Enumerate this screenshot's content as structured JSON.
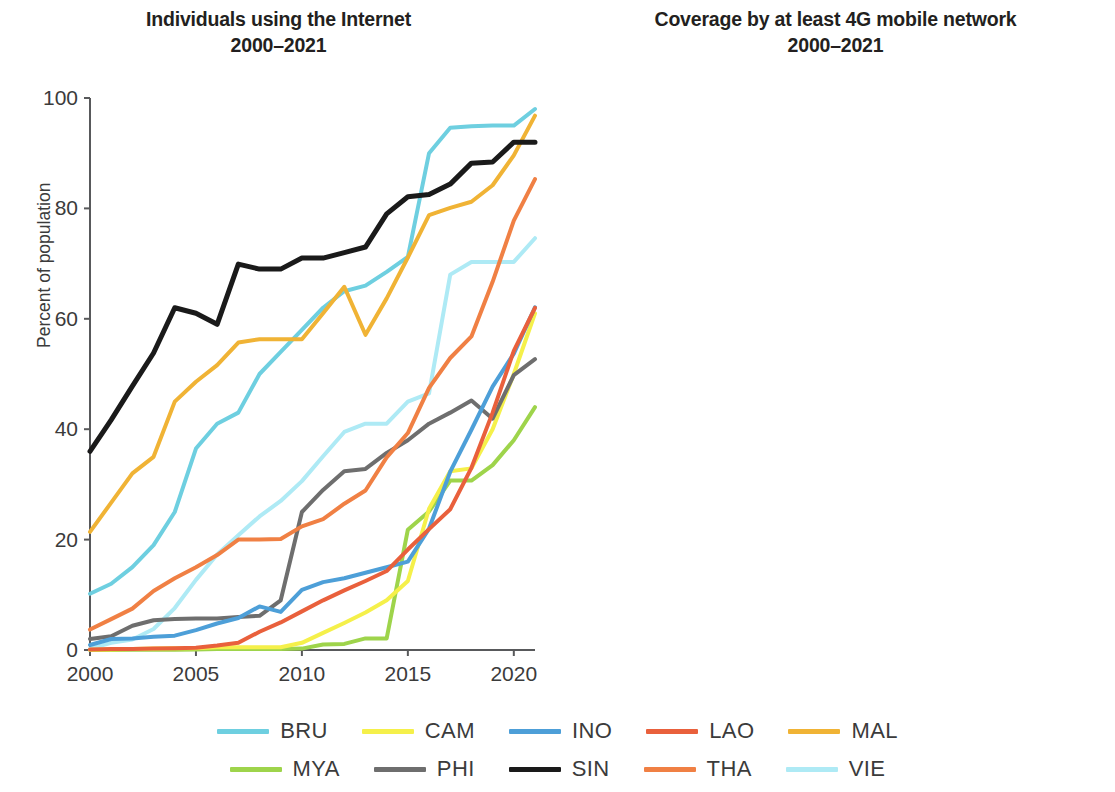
{
  "panels": [
    {
      "title": "Individuals using the Internet",
      "subtitle": "2000–2021"
    },
    {
      "title": "Coverage by at least 4G mobile network",
      "subtitle": "2000–2021"
    }
  ],
  "legend": {
    "rows": [
      [
        {
          "code": "BRU",
          "color": "#6ecfe0"
        },
        {
          "code": "CAM",
          "color": "#f5f04a"
        },
        {
          "code": "INO",
          "color": "#4d9fd8"
        },
        {
          "code": "LAO",
          "color": "#e9603c"
        },
        {
          "code": "MAL",
          "color": "#f0b335"
        }
      ],
      [
        {
          "code": "MYA",
          "color": "#9ed44b"
        },
        {
          "code": "PHI",
          "color": "#6e6e6e"
        },
        {
          "code": "SIN",
          "color": "#1a1a1a"
        },
        {
          "code": "THA",
          "color": "#f08044"
        },
        {
          "code": "VIE",
          "color": "#aeeaf5"
        }
      ]
    ]
  },
  "chart_data": [
    {
      "type": "line",
      "title": "Individuals using the Internet",
      "subtitle": "2000–2021",
      "xlabel": "",
      "ylabel": "Percent of population",
      "xlim": [
        2000,
        2021
      ],
      "ylim": [
        0,
        100
      ],
      "xticks": [
        2000,
        2005,
        2010,
        2015,
        2020
      ],
      "yticks": [
        0,
        20,
        40,
        60,
        80,
        100
      ],
      "grid": false,
      "legend_position": "bottom",
      "x": [
        2000,
        2001,
        2002,
        2003,
        2004,
        2005,
        2006,
        2007,
        2008,
        2009,
        2010,
        2011,
        2012,
        2013,
        2014,
        2015,
        2016,
        2017,
        2018,
        2019,
        2020,
        2021
      ],
      "series": [
        {
          "name": "BRU",
          "color": "#6ecfe0",
          "values": [
            10.2,
            12.0,
            15.0,
            19.0,
            25.0,
            36.5,
            41.0,
            43.0,
            50.0,
            54.0,
            58.0,
            62.0,
            65.0,
            66.0,
            68.5,
            71.2,
            90.0,
            94.6,
            94.9,
            95.0,
            95.0,
            98.0
          ]
        },
        {
          "name": "CAM",
          "color": "#f5f04a",
          "values": [
            0.05,
            0.08,
            0.17,
            0.25,
            0.3,
            0.3,
            0.5,
            0.5,
            0.5,
            0.5,
            1.3,
            3.1,
            4.9,
            6.8,
            9.0,
            12.5,
            25.6,
            32.4,
            32.9,
            40.0,
            50.0,
            61.0
          ]
        },
        {
          "name": "INO",
          "color": "#4d9fd8",
          "values": [
            0.9,
            2.0,
            2.1,
            2.4,
            2.6,
            3.6,
            4.8,
            5.8,
            7.9,
            6.9,
            10.9,
            12.3,
            13.0,
            14.0,
            15.0,
            16.0,
            22.0,
            32.3,
            39.9,
            47.7,
            53.7,
            62.1
          ]
        },
        {
          "name": "LAO",
          "color": "#e9603c",
          "values": [
            0.1,
            0.17,
            0.2,
            0.25,
            0.3,
            0.4,
            0.8,
            1.3,
            3.3,
            5.0,
            7.0,
            9.0,
            10.8,
            12.5,
            14.3,
            18.2,
            21.9,
            25.5,
            33.0,
            43.0,
            54.2,
            62.0
          ]
        },
        {
          "name": "MAL",
          "color": "#f0b335",
          "values": [
            21.4,
            26.7,
            32.0,
            35.0,
            45.0,
            48.6,
            51.6,
            55.7,
            56.3,
            56.3,
            56.3,
            61.0,
            65.8,
            57.1,
            63.7,
            71.1,
            78.8,
            80.1,
            81.2,
            84.2,
            89.6,
            96.8
          ]
        },
        {
          "name": "MYA",
          "color": "#9ed44b",
          "values": [
            0.0,
            0.02,
            0.03,
            0.05,
            0.06,
            0.07,
            0.2,
            0.2,
            0.2,
            0.2,
            0.25,
            1.0,
            1.1,
            2.1,
            2.1,
            21.8,
            25.1,
            30.7,
            30.7,
            33.5,
            38.0,
            44.0
          ]
        },
        {
          "name": "PHI",
          "color": "#6e6e6e",
          "values": [
            2.0,
            2.5,
            4.4,
            5.4,
            5.6,
            5.7,
            5.7,
            6.0,
            6.2,
            9.0,
            25.0,
            29.0,
            32.4,
            32.8,
            35.7,
            38.0,
            41.0,
            43.0,
            45.2,
            41.9,
            49.8,
            52.7
          ]
        },
        {
          "name": "SIN",
          "color": "#1a1a1a",
          "values": [
            36.0,
            41.7,
            47.8,
            53.8,
            62.0,
            61.0,
            59.0,
            69.9,
            69.0,
            69.0,
            71.0,
            71.0,
            72.0,
            73.0,
            79.0,
            82.1,
            82.5,
            84.4,
            88.2,
            88.4,
            92.0,
            92.0
          ]
        },
        {
          "name": "THA",
          "color": "#f08044",
          "values": [
            3.7,
            5.6,
            7.5,
            10.7,
            13.0,
            15.0,
            17.2,
            20.0,
            20.0,
            20.1,
            22.4,
            23.7,
            26.5,
            28.9,
            34.9,
            39.3,
            47.5,
            52.9,
            56.8,
            66.7,
            77.8,
            85.3
          ]
        },
        {
          "name": "VIE",
          "color": "#aeeaf5",
          "values": [
            0.25,
            1.3,
            1.9,
            3.8,
            7.6,
            12.7,
            17.3,
            20.8,
            24.2,
            27.0,
            30.6,
            35.1,
            39.5,
            41.0,
            41.0,
            45.0,
            46.5,
            68.0,
            70.3,
            70.3,
            70.3,
            74.6
          ]
        }
      ]
    },
    {
      "type": "line",
      "title": "Coverage by at least 4G mobile network",
      "subtitle": "2000–2021",
      "xlabel": "",
      "ylabel": "",
      "xlim": [
        2012,
        2021
      ],
      "ylim": [
        0,
        100
      ],
      "xticks": [
        2012,
        2014,
        2016,
        2018,
        2020
      ],
      "yticks": [
        0,
        20,
        40,
        60,
        80,
        100
      ],
      "grid": false,
      "legend_position": "bottom",
      "x": [
        2012,
        2013,
        2014,
        2015,
        2016,
        2017,
        2018,
        2019,
        2020,
        2021
      ],
      "series": [
        {
          "name": "BRU",
          "color": "#6ecfe0",
          "values": [
            null,
            null,
            10.0,
            80.0,
            88.6,
            88.6,
            88.6,
            95.0,
            96.0,
            96.5
          ]
        },
        {
          "name": "CAM",
          "color": "#f5f04a",
          "values": [
            null,
            null,
            9.0,
            12.0,
            30.0,
            50.0,
            61.0,
            73.0,
            84.0,
            91.0
          ]
        },
        {
          "name": "INO",
          "color": "#4d9fd8",
          "values": [
            null,
            5.0,
            10.5,
            5.0,
            21.0,
            53.0,
            75.0,
            95.0,
            96.5,
            95.0
          ]
        },
        {
          "name": "LAO",
          "color": "#e9603c",
          "values": [
            null,
            null,
            2.0,
            5.0,
            7.5,
            9.5,
            42.0,
            42.0,
            42.0,
            42.0
          ]
        },
        {
          "name": "MAL",
          "color": "#f0b335",
          "values": [
            null,
            16.0,
            33.0,
            70.0,
            86.5,
            75.0,
            78.0,
            81.0,
            88.0,
            92.0
          ]
        },
        {
          "name": "MYA",
          "color": "#9ed44b",
          "values": [
            null,
            null,
            0.5,
            2.0,
            5.0,
            26.0,
            53.0,
            76.0,
            92.0,
            92.5
          ]
        },
        {
          "name": "PHI",
          "color": "#6e6e6e",
          "values": [
            7.0,
            27.0,
            46.5,
            38.0,
            79.7,
            79.7,
            79.7,
            79.7,
            79.7,
            79.7
          ]
        },
        {
          "name": "SIN",
          "color": "#1a1a1a",
          "values": [
            null,
            null,
            97.5,
            99.5,
            99.5,
            99.5,
            99.5,
            99.5,
            99.5,
            99.5
          ]
        },
        {
          "name": "THA",
          "color": "#f08044",
          "values": [
            null,
            null,
            2.5,
            20.0,
            97.0,
            97.0,
            97.0,
            97.0,
            97.0,
            97.0
          ]
        },
        {
          "name": "VIE",
          "color": "#aeeaf5",
          "values": [
            null,
            null,
            0.0,
            0.0,
            5.0,
            93.0,
            94.0,
            95.0,
            97.0,
            97.5
          ]
        }
      ]
    }
  ]
}
